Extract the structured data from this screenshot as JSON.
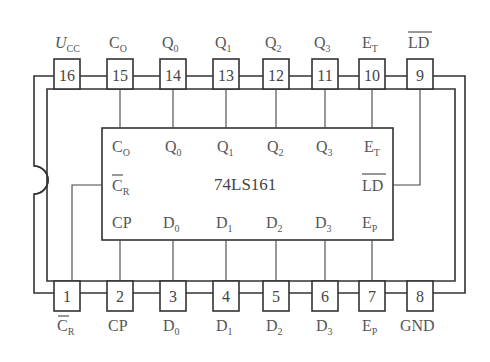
{
  "chip": {
    "name": "74LS161"
  },
  "top_pins": [
    {
      "number": "16",
      "label": "U",
      "sub": "CC",
      "italic": true,
      "overline": false
    },
    {
      "number": "15",
      "label": "C",
      "sub": "O",
      "italic": false,
      "overline": false
    },
    {
      "number": "14",
      "label": "Q",
      "sub": "0",
      "italic": false,
      "overline": false
    },
    {
      "number": "13",
      "label": "Q",
      "sub": "1",
      "italic": false,
      "overline": false
    },
    {
      "number": "12",
      "label": "Q",
      "sub": "2",
      "italic": false,
      "overline": false
    },
    {
      "number": "11",
      "label": "Q",
      "sub": "3",
      "italic": false,
      "overline": false
    },
    {
      "number": "10",
      "label": "E",
      "sub": "T",
      "italic": false,
      "overline": false
    },
    {
      "number": "9",
      "label": "LD",
      "sub": "",
      "italic": false,
      "overline": true
    }
  ],
  "bottom_pins": [
    {
      "number": "1",
      "label": "C",
      "sub": "R",
      "overline": true
    },
    {
      "number": "2",
      "label": "CP",
      "sub": "",
      "overline": false
    },
    {
      "number": "3",
      "label": "D",
      "sub": "0",
      "overline": false
    },
    {
      "number": "4",
      "label": "D",
      "sub": "1",
      "overline": false
    },
    {
      "number": "5",
      "label": "D",
      "sub": "2",
      "overline": false
    },
    {
      "number": "6",
      "label": "D",
      "sub": "3",
      "overline": false
    },
    {
      "number": "7",
      "label": "E",
      "sub": "P",
      "overline": false
    },
    {
      "number": "8",
      "label": "GND",
      "sub": "",
      "overline": false
    }
  ],
  "inner_top": [
    {
      "label": "C",
      "sub": "O"
    },
    {
      "label": "Q",
      "sub": "0"
    },
    {
      "label": "Q",
      "sub": "1"
    },
    {
      "label": "Q",
      "sub": "2"
    },
    {
      "label": "Q",
      "sub": "3"
    },
    {
      "label": "E",
      "sub": "T"
    }
  ],
  "inner_middle": {
    "left": {
      "label": "C",
      "sub": "R",
      "overline": true
    },
    "right": {
      "label": "LD",
      "overline": true
    }
  },
  "inner_bottom": [
    {
      "label": "CP",
      "sub": ""
    },
    {
      "label": "D",
      "sub": "0"
    },
    {
      "label": "D",
      "sub": "1"
    },
    {
      "label": "D",
      "sub": "2"
    },
    {
      "label": "D",
      "sub": "3"
    },
    {
      "label": "E",
      "sub": "P"
    }
  ]
}
